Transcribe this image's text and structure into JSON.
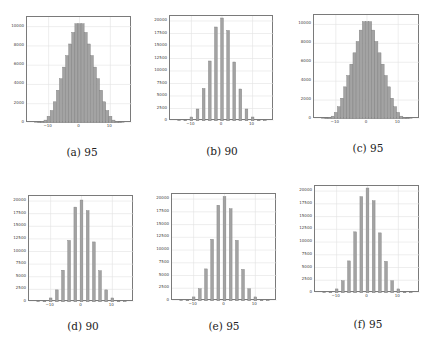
{
  "figure": {
    "captions": [
      "(a) 95",
      "(b) 90",
      "(c) 95",
      "(d) 90",
      "(e) 95",
      "(f) 95"
    ]
  },
  "colors": {
    "bar_fill": "#a3a3a3",
    "bar_edge": "#7d7d7d",
    "grid": "#e2e2e2",
    "axis": "#7a7a7a"
  },
  "chart_data": [
    {
      "id": "a",
      "type": "bar",
      "title": "(a) 95",
      "xlabel": "",
      "ylabel": "",
      "x_ticks": [
        "-10",
        "0",
        "10"
      ],
      "y_ticks": [
        "0",
        "2000",
        "4000",
        "6000",
        "8000",
        "10000"
      ],
      "xlim": [
        -17,
        17
      ],
      "ylim": [
        0,
        11000
      ],
      "grid": true,
      "bins_style": "continuous",
      "x": [
        -14,
        -13,
        -12,
        -11,
        -10,
        -9,
        -8,
        -7,
        -6,
        -5,
        -4,
        -3,
        -2,
        -1,
        0,
        1,
        2,
        3,
        4,
        5,
        6,
        7,
        8,
        9,
        10,
        11,
        12,
        13,
        14
      ],
      "values": [
        20,
        60,
        150,
        300,
        700,
        1300,
        2200,
        3400,
        4600,
        5800,
        7000,
        8200,
        9400,
        10300,
        10300,
        10300,
        9400,
        8200,
        7000,
        5800,
        4600,
        3400,
        2200,
        1300,
        700,
        300,
        150,
        60,
        20
      ]
    },
    {
      "id": "b",
      "type": "bar",
      "title": "(b) 90",
      "xlabel": "",
      "ylabel": "",
      "x_ticks": [
        "-10",
        "0",
        "10"
      ],
      "y_ticks": [
        "0",
        "2500",
        "5000",
        "7500",
        "10000",
        "12500",
        "15000",
        "17500",
        "20000"
      ],
      "xlim": [
        -17,
        17
      ],
      "ylim": [
        0,
        21000
      ],
      "grid": true,
      "bins_style": "discrete",
      "x": [
        -14,
        -12,
        -10,
        -8,
        -6,
        -4,
        -2,
        0,
        2,
        4,
        6,
        8,
        10,
        12,
        14
      ],
      "values": [
        50,
        200,
        800,
        2400,
        6500,
        12000,
        18800,
        20600,
        18100,
        11800,
        6400,
        2400,
        800,
        200,
        50
      ]
    },
    {
      "id": "c",
      "type": "bar",
      "title": "(c) 95",
      "xlabel": "",
      "ylabel": "",
      "x_ticks": [
        "-10",
        "0",
        "10"
      ],
      "y_ticks": [
        "0",
        "2000",
        "4000",
        "6000",
        "8000",
        "10000"
      ],
      "xlim": [
        -17,
        17
      ],
      "ylim": [
        0,
        11000
      ],
      "grid": true,
      "bins_style": "continuous",
      "x": [
        -14,
        -13,
        -12,
        -11,
        -10,
        -9,
        -8,
        -7,
        -6,
        -5,
        -4,
        -3,
        -2,
        -1,
        0,
        1,
        2,
        3,
        4,
        5,
        6,
        7,
        8,
        9,
        10,
        11,
        12,
        13,
        14
      ],
      "values": [
        20,
        60,
        150,
        300,
        700,
        1300,
        2200,
        3400,
        4600,
        5800,
        7000,
        8200,
        9400,
        10300,
        10300,
        10300,
        9400,
        8200,
        7000,
        5800,
        4600,
        3400,
        2200,
        1300,
        700,
        300,
        150,
        60,
        20
      ]
    },
    {
      "id": "d",
      "type": "bar",
      "title": "(d) 90",
      "xlabel": "",
      "ylabel": "",
      "x_ticks": [
        "-10",
        "0",
        "10"
      ],
      "y_ticks": [
        "0",
        "2500",
        "5000",
        "7500",
        "10000",
        "12500",
        "15000",
        "17500",
        "20000"
      ],
      "xlim": [
        -17,
        17
      ],
      "ylim": [
        0,
        21000
      ],
      "grid": true,
      "bins_style": "discrete",
      "x": [
        -14,
        -12,
        -10,
        -8,
        -6,
        -4,
        -2,
        0,
        2,
        4,
        6,
        8,
        10,
        12,
        14
      ],
      "values": [
        50,
        200,
        800,
        2400,
        6300,
        12200,
        18800,
        20200,
        18100,
        11900,
        6200,
        2400,
        800,
        200,
        50
      ]
    },
    {
      "id": "e",
      "type": "bar",
      "title": "(e) 95",
      "xlabel": "",
      "ylabel": "",
      "x_ticks": [
        "-10",
        "0",
        "10"
      ],
      "y_ticks": [
        "0",
        "2500",
        "5000",
        "7500",
        "10000",
        "12500",
        "15000",
        "17500",
        "20000"
      ],
      "xlim": [
        -17,
        17
      ],
      "ylim": [
        0,
        21000
      ],
      "grid": true,
      "bins_style": "discrete",
      "x": [
        -14,
        -12,
        -10,
        -8,
        -6,
        -4,
        -2,
        0,
        2,
        4,
        6,
        8,
        10,
        12,
        14
      ],
      "values": [
        50,
        200,
        800,
        2400,
        6300,
        12100,
        18800,
        20500,
        18100,
        11900,
        6200,
        2400,
        800,
        200,
        50
      ]
    },
    {
      "id": "f",
      "type": "bar",
      "title": "(f) 95",
      "xlabel": "",
      "ylabel": "",
      "x_ticks": [
        "-10",
        "0",
        "10"
      ],
      "y_ticks": [
        "0",
        "2500",
        "5000",
        "7500",
        "10000",
        "12500",
        "15000",
        "17500",
        "20000"
      ],
      "xlim": [
        -17,
        17
      ],
      "ylim": [
        0,
        21000
      ],
      "grid": true,
      "bins_style": "discrete",
      "x": [
        -14,
        -12,
        -10,
        -8,
        -6,
        -4,
        -2,
        0,
        2,
        4,
        6,
        8,
        10,
        12,
        14
      ],
      "values": [
        50,
        200,
        800,
        2400,
        6300,
        12000,
        18900,
        20600,
        18100,
        11800,
        6200,
        2400,
        800,
        200,
        50
      ]
    }
  ]
}
